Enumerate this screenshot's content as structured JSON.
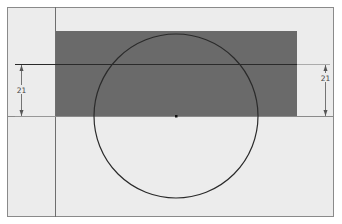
{
  "diagram": {
    "colors": {
      "background": "#ffffff",
      "sheet": "#ececec",
      "sheet_border": "#8a8a8a",
      "fill_rect": "#6a6a6a",
      "line": "#2a2a2a",
      "dim_line": "#555555"
    },
    "sheet": {
      "x": 7,
      "y": 7,
      "w": 327,
      "h": 210
    },
    "vertical_guide_x": 55,
    "horizontal_guide_y": 116,
    "filled_rect": {
      "x": 55,
      "y": 31,
      "w": 242,
      "h": 85
    },
    "top_line_y": 64,
    "circle": {
      "cx": 176,
      "cy": 116,
      "r": 82
    },
    "center_point": {
      "x": 176,
      "y": 116
    },
    "dimensions": {
      "left": {
        "label": "21",
        "x": 21,
        "y1": 64,
        "y2": 116
      },
      "right": {
        "label": "21",
        "x": 325,
        "y1": 64,
        "y2": 116
      }
    }
  }
}
